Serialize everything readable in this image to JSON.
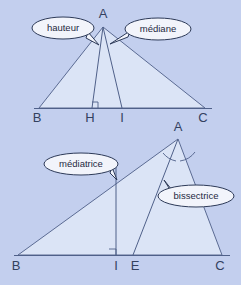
{
  "figure": {
    "background_color": "#c3cfee",
    "triangle_fill_color": "#dbe4f6",
    "line_color": "#4f6089",
    "bubble_fill_color": "#f2f4fb",
    "bubble_stroke_color": "#2d3a58"
  },
  "top_diagram": {
    "name": "triangle-hauteur-mediane",
    "vertices": [
      {
        "label": "A",
        "x": 103,
        "y": 27
      },
      {
        "label": "B",
        "x": 39,
        "y": 108
      },
      {
        "label": "C",
        "x": 205,
        "y": 108
      },
      {
        "label": "H",
        "x": 92,
        "y": 108
      },
      {
        "label": "I",
        "x": 122,
        "y": 108
      }
    ],
    "vertex_labels": [
      {
        "text": "A",
        "x": 103,
        "y": 18
      },
      {
        "text": "B",
        "x": 37,
        "y": 122
      },
      {
        "text": "H",
        "x": 90,
        "y": 122
      },
      {
        "text": "I",
        "x": 122,
        "y": 122
      },
      {
        "text": "C",
        "x": 203,
        "y": 122
      }
    ],
    "callouts": [
      {
        "label": "hauteur",
        "bubble_cx": 63,
        "bubble_cy": 28,
        "bubble_rx": 31,
        "bubble_ry": 11,
        "target_x": 96,
        "target_y": 45
      },
      {
        "label": "médiane",
        "bubble_cx": 158,
        "bubble_cy": 29,
        "bubble_rx": 33,
        "bubble_ry": 11,
        "target_x": 112,
        "target_y": 44
      }
    ],
    "cevians": [
      {
        "name": "hauteur",
        "from": "A",
        "to": "H",
        "kind": "altitude",
        "right_angle_at": "H"
      },
      {
        "name": "médiane",
        "from": "A",
        "to": "I",
        "kind": "median"
      }
    ]
  },
  "bottom_diagram": {
    "name": "triangle-mediatrice-bissectrice",
    "vertices": [
      {
        "label": "A",
        "x": 178,
        "y": 139
      },
      {
        "label": "B",
        "x": 18,
        "y": 255
      },
      {
        "label": "C",
        "x": 222,
        "y": 255
      },
      {
        "label": "I",
        "x": 116,
        "y": 255
      },
      {
        "label": "E",
        "x": 133,
        "y": 255
      }
    ],
    "vertex_labels": [
      {
        "text": "A",
        "x": 178,
        "y": 131
      },
      {
        "text": "B",
        "x": 16,
        "y": 270
      },
      {
        "text": "I",
        "x": 116,
        "y": 270
      },
      {
        "text": "E",
        "x": 134,
        "y": 270
      },
      {
        "text": "C",
        "x": 220,
        "y": 270
      }
    ],
    "callouts": [
      {
        "label": "médiatrice",
        "bubble_cx": 81,
        "bubble_cy": 164,
        "bubble_rx": 37,
        "bubble_ry": 11,
        "target_x": 116,
        "target_y": 180
      },
      {
        "label": "bissectrice",
        "bubble_cx": 196,
        "bubble_cy": 196,
        "bubble_rx": 38,
        "bubble_ry": 11,
        "target_x": 165,
        "target_y": 180
      }
    ],
    "cevians": [
      {
        "name": "médiatrice",
        "kind": "perpendicular-bisector",
        "right_angle_at": "I"
      },
      {
        "name": "bissectrice",
        "from": "A",
        "to": "E",
        "kind": "angle-bisector"
      }
    ]
  }
}
